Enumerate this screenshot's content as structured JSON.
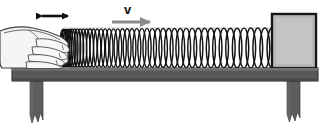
{
  "figure": {
    "type": "physics-diagram",
    "background_color": "#ffffff"
  },
  "labels": {
    "velocity_symbol": "v",
    "oscillation_arrow_name": "hand-oscillation-double-arrow",
    "velocity_arrow_name": "wave-velocity-arrow"
  },
  "colors": {
    "table_top": "#5a5a5a",
    "table_top_highlight": "#6e6e6e",
    "table_leg": "#5a5a5a",
    "block": "#c0c0c0",
    "block_border": "#1a1a1a",
    "spring_stroke": "#111111",
    "hand_fill": "#f2f2f2",
    "hand_stroke": "#3a3a3a",
    "velocity_arrow": "#8a8a8a",
    "oscillation_arrow": "#111111",
    "outline": "#111111"
  },
  "geometry": {
    "canvas": {
      "width": 329,
      "height": 140
    },
    "table_top": {
      "x": 12,
      "y": 68,
      "width": 306,
      "height": 13
    },
    "table_leg_left": {
      "x": 30,
      "y": 81,
      "width": 13,
      "height": 45
    },
    "table_leg_right": {
      "x": 287,
      "y": 81,
      "width": 13,
      "height": 45
    },
    "block": {
      "x": 272,
      "y": 14,
      "width": 44,
      "height": 54
    },
    "hand": {
      "x": 2,
      "y": 26,
      "width": 72,
      "height": 43
    },
    "spring": {
      "x_start": 63,
      "x_end": 272,
      "y_top": 28,
      "y_bottom": 68
    },
    "oscillation_arrow": {
      "x1": 36,
      "x2": 74,
      "y": 16
    },
    "velocity_arrow": {
      "x1": 112,
      "x2": 158,
      "y": 22
    }
  },
  "spring_data": {
    "coil_count": 46,
    "compression_note": "coils bunched (compressed) near the hand at left, evenly spaced toward the right",
    "dense_region_end_x": 130
  }
}
